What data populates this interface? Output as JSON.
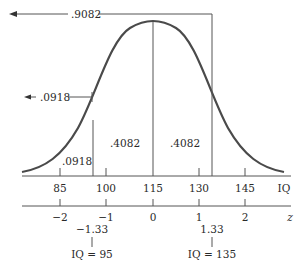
{
  "diagram": {
    "type": "normal-distribution",
    "top_annotation": {
      "value": ".9082",
      "direction": "left-arrow"
    },
    "left_annotation": {
      "value": ".0918",
      "direction": "left-arrow"
    },
    "region_labels": {
      "left_tail": ".0918",
      "left_center": ".4082",
      "right_center": ".4082"
    },
    "iq_axis": {
      "label": "IQ",
      "ticks": [
        "85",
        "100",
        "115",
        "130",
        "145"
      ]
    },
    "z_axis": {
      "label": "z",
      "ticks": [
        "−2",
        "−1",
        "0",
        "1",
        "2"
      ]
    },
    "markers": [
      {
        "z": "−1.33",
        "iq": "IQ = 95"
      },
      {
        "z": "1.33",
        "iq": "IQ = 135"
      }
    ]
  },
  "colors": {
    "curve": "#4a4a4a",
    "lines": "#555555",
    "text": "#2a2a2a",
    "background": "#ffffff"
  }
}
